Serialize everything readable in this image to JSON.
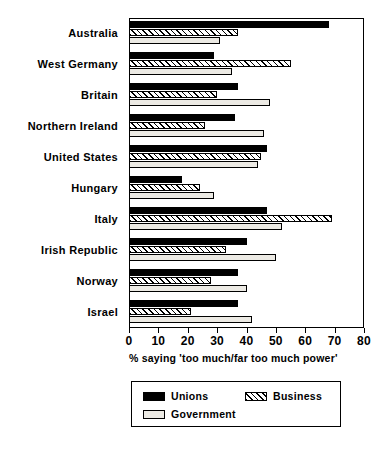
{
  "chart_data": {
    "type": "bar",
    "orientation": "horizontal",
    "title": "",
    "subtitle": "",
    "xlabel": "% saying 'too much/far too much power'",
    "ylabel": "",
    "xlim": [
      0,
      80
    ],
    "xticks": [
      0,
      10,
      20,
      30,
      40,
      50,
      60,
      70,
      80
    ],
    "xticklabels": [
      "0",
      "10",
      "20",
      "30",
      "40",
      "50",
      "60",
      "70",
      "80"
    ],
    "grid": false,
    "legend_position": "below-axes",
    "categories": [
      "Australia",
      "West Germany",
      "Britain",
      "Northern Ireland",
      "United States",
      "Hungary",
      "Italy",
      "Irish Republic",
      "Norway",
      "Israel"
    ],
    "series": [
      {
        "name": "Unions",
        "color": "#000000",
        "pattern": "solid",
        "values": [
          68,
          29,
          37,
          36,
          47,
          18,
          47,
          40,
          37,
          37
        ]
      },
      {
        "name": "Business",
        "color": "#ffffff",
        "pattern": "diagonal-hatch",
        "values": [
          37,
          55,
          30,
          26,
          45,
          24,
          69,
          33,
          28,
          21
        ]
      },
      {
        "name": "Government",
        "color": "#eceae4",
        "pattern": "light-fill",
        "values": [
          31,
          35,
          48,
          46,
          44,
          29,
          52,
          50,
          40,
          42
        ]
      }
    ]
  },
  "legend": {
    "entries": [
      {
        "label": "Unions"
      },
      {
        "label": "Business"
      },
      {
        "label": "Government"
      }
    ]
  }
}
